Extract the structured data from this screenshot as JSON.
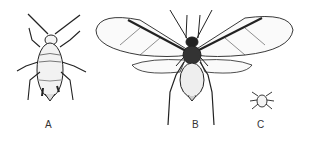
{
  "figure": {
    "labels": {
      "a": "A",
      "b": "B",
      "c": "C"
    },
    "specimens": [
      {
        "label": "A",
        "form": "wingless adult aphid"
      },
      {
        "label": "B",
        "form": "winged adult aphid"
      },
      {
        "label": "C",
        "form": "nymph"
      }
    ],
    "colors": {
      "ink": "#222222",
      "background": "#ffffff"
    }
  }
}
